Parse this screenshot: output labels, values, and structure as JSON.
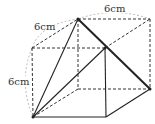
{
  "figure": {
    "type": "cube-with-pyramid",
    "labels": {
      "top_edge": "6cm",
      "depth_edge": "6cm",
      "height_edge": "6cm"
    },
    "colors": {
      "line": "#222222",
      "dashed": "#333333",
      "arc": "#999999",
      "text": "#333333"
    }
  }
}
